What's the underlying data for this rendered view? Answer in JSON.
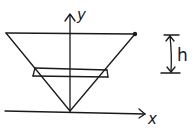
{
  "figure": {
    "type": "hand-drawn sketch",
    "labels": {
      "y_axis": "y",
      "x_axis": "x",
      "height": "h"
    },
    "elements": [
      "y-axis arrow",
      "x-axis arrow",
      "inverted cone outline",
      "point on cone rim",
      "horizontal disc slice",
      "height dimension marker"
    ],
    "colors": {
      "ink": "#1a1a1a",
      "background": "#ffffff"
    }
  }
}
